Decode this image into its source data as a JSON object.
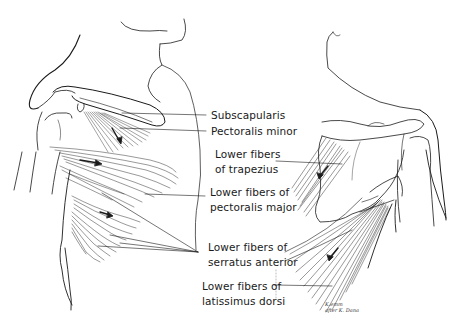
{
  "figure": {
    "stroke_color": "#1a1a1a",
    "background": "#ffffff"
  },
  "labels": [
    {
      "id": "subscapularis",
      "lines": [
        "Subscapularis"
      ]
    },
    {
      "id": "pectoralis-minor",
      "lines": [
        "Pectoralis minor"
      ]
    },
    {
      "id": "lower-trapezius",
      "lines": [
        "Lower fibers",
        "of trapezius"
      ]
    },
    {
      "id": "lower-pectoralis-major",
      "lines": [
        "Lower fibers of",
        "pectoralis major"
      ]
    },
    {
      "id": "lower-serratus-anterior",
      "lines": [
        "Lower fibers of",
        "serratus anterior"
      ]
    },
    {
      "id": "lower-latissimus-dorsi",
      "lines": [
        "Lower fibers of",
        "latissimus dorsi"
      ]
    }
  ],
  "signature": {
    "line1": "K.emm",
    "line2": "after K. Dana"
  }
}
